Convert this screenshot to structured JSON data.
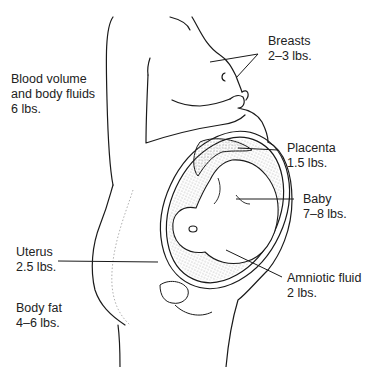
{
  "diagram": {
    "labels": [
      {
        "id": "breasts",
        "name": "Breasts",
        "value": "2–3 lbs."
      },
      {
        "id": "blood",
        "name_line1": "Blood volume",
        "name_line2": "and body fluids",
        "value": "6 lbs."
      },
      {
        "id": "placenta",
        "name": "Placenta",
        "value": "1.5 lbs."
      },
      {
        "id": "baby",
        "name": "Baby",
        "value": "7–8 lbs."
      },
      {
        "id": "uterus",
        "name": "Uterus",
        "value": "2.5 lbs."
      },
      {
        "id": "amniotic",
        "name": "Amniotic fluid",
        "value": "2 lbs."
      },
      {
        "id": "bodyfat",
        "name": "Body fat",
        "value": "4–6 lbs."
      }
    ],
    "colors": {
      "line": "#1a1a1a",
      "stipple": "#bdbdbd",
      "background": "#ffffff"
    }
  }
}
